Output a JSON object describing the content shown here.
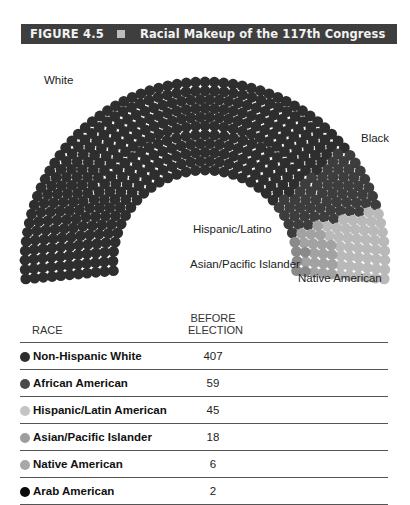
{
  "figure": {
    "number": "FIGURE 4.5",
    "title": "Racial Makeup of the 117th Congress"
  },
  "chart_data": {
    "type": "hemicycle",
    "title": "Racial Makeup of the 117th Congress",
    "groups": [
      {
        "name": "White",
        "count": 407,
        "color": "#2e2e2e"
      },
      {
        "name": "Black",
        "count": 59,
        "color": "#3d3d3d"
      },
      {
        "name": "Hispanic/Latino",
        "count": 45,
        "color": "#b9b9b9"
      },
      {
        "name": "Asian/Pacific Islander",
        "count": 18,
        "color": "#a2a2a2"
      },
      {
        "name": "Native American",
        "count": 6,
        "color": "#8a8a8a"
      }
    ],
    "table": {
      "columns": [
        "RACE",
        "BEFORE ELECTION"
      ],
      "rows": [
        {
          "race": "Non-Hispanic White",
          "value": 407,
          "color": "#2e2e2e"
        },
        {
          "race": "African American",
          "value": 59,
          "color": "#4a4a4a"
        },
        {
          "race": "Hispanic/Latin American",
          "value": 45,
          "color": "#c4c4c4"
        },
        {
          "race": "Asian/Pacific Islander",
          "value": 18,
          "color": "#9e9e9e"
        },
        {
          "race": "Native American",
          "value": 6,
          "color": "#a8a8a8"
        },
        {
          "race": "Arab American",
          "value": 2,
          "color": "#0a0a0a"
        }
      ]
    }
  },
  "labels": {
    "white": "White",
    "black": "Black",
    "hispanic": "Hispanic/Latino",
    "asian": "Asian/Pacific Islander",
    "native": "Native American"
  },
  "table": {
    "col_race": "RACE",
    "col_before_line1": "BEFORE",
    "col_before_line2": "ELECTION",
    "rows": [
      {
        "race": "Non-Hispanic White",
        "value": "407"
      },
      {
        "race": "African American",
        "value": "59"
      },
      {
        "race": "Hispanic/Latin American",
        "value": "45"
      },
      {
        "race": "Asian/Pacific Islander",
        "value": "18"
      },
      {
        "race": "Native American",
        "value": "6"
      },
      {
        "race": "Arab American",
        "value": "2"
      }
    ]
  }
}
